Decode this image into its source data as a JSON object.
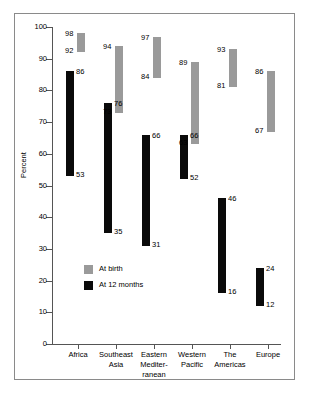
{
  "chart_data": {
    "type": "bar",
    "title": "",
    "subtitle": "",
    "xlabel": "",
    "ylabel": "Percent",
    "ylim": [
      0,
      100
    ],
    "ytick_labels": [
      "100",
      "90",
      "80",
      "70",
      "60",
      "50",
      "40",
      "30",
      "20",
      "10",
      "0"
    ],
    "ytick_values": [
      100,
      90,
      80,
      70,
      60,
      50,
      40,
      30,
      20,
      10,
      0
    ],
    "grid": false,
    "legend_position": "inside-lower-left",
    "categories": [
      "Africa",
      "Southeast Asia",
      "Eastern Mediterranean",
      "Western Pacific",
      "The Americas",
      "Europe"
    ],
    "category_lines": [
      [
        "Africa"
      ],
      [
        "Southeast",
        "Asia"
      ],
      [
        "Eastern",
        "Mediter-",
        "ranean"
      ],
      [
        "Western",
        "Pacific"
      ],
      [
        "The",
        "Americas"
      ],
      [
        "Europe"
      ]
    ],
    "series": [
      {
        "name": "At birth",
        "color": "#9a9a9a",
        "ranges": [
          {
            "category": "Africa",
            "low": 92,
            "high": 98
          },
          {
            "category": "Southeast Asia",
            "low": 73,
            "high": 94
          },
          {
            "category": "Eastern Mediterranean",
            "low": 84,
            "high": 97
          },
          {
            "category": "Western Pacific",
            "low": 63,
            "high": 89
          },
          {
            "category": "The Americas",
            "low": 81,
            "high": 93
          },
          {
            "category": "Europe",
            "low": 67,
            "high": 86
          }
        ]
      },
      {
        "name": "At 12 months",
        "color": "#0a0a0a",
        "ranges": [
          {
            "category": "Africa",
            "low": 53,
            "high": 86
          },
          {
            "category": "Southeast Asia",
            "low": 35,
            "high": 76
          },
          {
            "category": "Eastern Mediterranean",
            "low": 31,
            "high": 66
          },
          {
            "category": "Western Pacific",
            "low": 52,
            "high": 66
          },
          {
            "category": "The Americas",
            "low": 16,
            "high": 46
          },
          {
            "category": "Europe",
            "low": 12,
            "high": 24
          }
        ]
      }
    ],
    "legend": [
      {
        "label": "At birth",
        "color": "#9a9a9a"
      },
      {
        "label": "At 12 months",
        "color": "#0a0a0a"
      }
    ],
    "value_labels": [
      "98",
      "92",
      "86",
      "53",
      "94",
      "73",
      "76",
      "35",
      "97",
      "84",
      "66",
      "31",
      "89",
      "63",
      "66",
      "52",
      "93",
      "81",
      "46",
      "16",
      "86",
      "67",
      "24",
      "12"
    ]
  }
}
